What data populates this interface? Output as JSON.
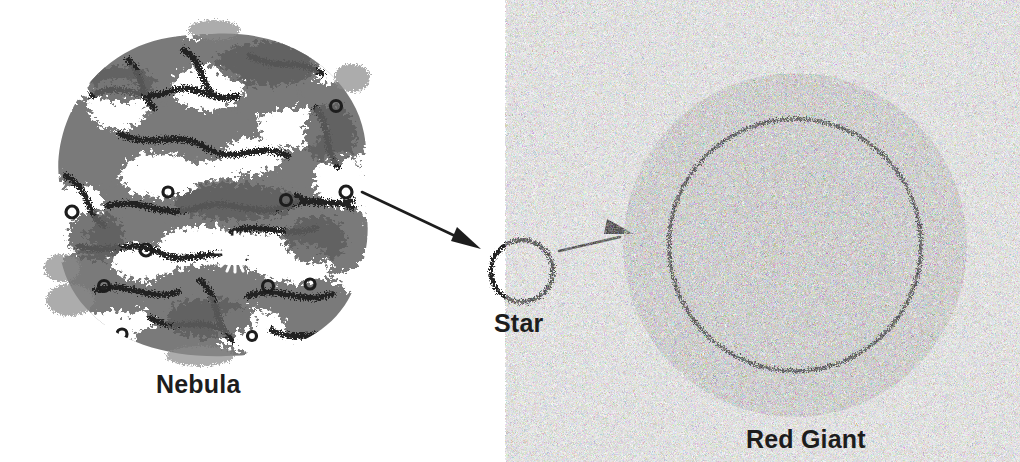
{
  "figure": {
    "background_color": "#ffffff",
    "ink_color": "#1d1d1d",
    "cloud_gray": "#767676",
    "dark_gray": "#3a3a3a"
  },
  "stages": [
    {
      "id": "nebula",
      "label": "Nebula",
      "shape": "irregular-cloud",
      "center_x": 212,
      "center_y": 190,
      "radius": 152,
      "label_x": 156,
      "label_y": 370
    },
    {
      "id": "star",
      "label": "Star",
      "shape": "small-ring",
      "center_x": 522,
      "center_y": 271,
      "radius": 32,
      "label_x": 494,
      "label_y": 309
    },
    {
      "id": "red-giant",
      "label": "Red Giant",
      "shape": "large-ring",
      "center_x": 795,
      "center_y": 245,
      "radius": 170,
      "label_x": 746,
      "label_y": 425
    }
  ],
  "arrows": [
    {
      "id": "arrow-nebula-to-star",
      "from": "nebula",
      "to": "star",
      "x1": 362,
      "y1": 192,
      "x2": 481,
      "y2": 249
    },
    {
      "id": "arrow-star-to-red-giant",
      "from": "star",
      "to": "red-giant",
      "x1": 559,
      "y1": 251,
      "x2": 634,
      "y2": 234
    }
  ],
  "icons": {
    "nebula_cloud": "nebula-cloud-icon",
    "star_ring": "star-ring-icon",
    "red_giant_ring": "red-giant-ring-icon",
    "arrow": "arrow-icon"
  }
}
